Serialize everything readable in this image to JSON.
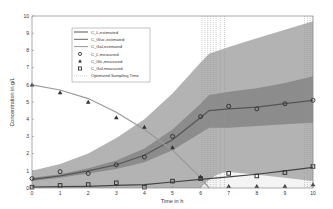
{
  "chart_data": {
    "type": "line",
    "title": "",
    "xlabel": "Time in h",
    "ylabel": "Concentration in g/L",
    "xlim": [
      0,
      10
    ],
    "ylim": [
      0,
      10
    ],
    "xticks": [
      "0",
      "1",
      "2",
      "3",
      "4",
      "5",
      "6",
      "7",
      "8",
      "9",
      "10"
    ],
    "yticks": [
      "0",
      "1",
      "2",
      "3",
      "4",
      "5",
      "6",
      "7",
      "8",
      "9",
      "10"
    ],
    "grid": false,
    "legend_position": "upper-left-inside",
    "legend": [
      {
        "label": "C_L,estimated",
        "style": "line",
        "color": "#555555"
      },
      {
        "label": "C_Gluc,estimated",
        "style": "line",
        "color": "#666666"
      },
      {
        "label": "C_Gal,estimated",
        "style": "line",
        "color": "#999999"
      },
      {
        "label": "C_L,measured",
        "style": "circle",
        "color": "#333333"
      },
      {
        "label": "C_Glc,measured",
        "style": "triangle",
        "color": "#333333"
      },
      {
        "label": "C_Gal,measured",
        "style": "square",
        "color": "#333333"
      },
      {
        "label": "Optimized Sampling Time",
        "style": "dotted",
        "color": "#aaaaaa"
      }
    ],
    "series": [
      {
        "name": "C_L,estimated",
        "kind": "line",
        "x": [
          0,
          1,
          2,
          3,
          4,
          5,
          6,
          6.3,
          7,
          8,
          9,
          10
        ],
        "y": [
          0.5,
          0.7,
          1.0,
          1.35,
          1.9,
          2.8,
          4.1,
          4.5,
          4.6,
          4.7,
          4.9,
          5.1
        ]
      },
      {
        "name": "C_Gluc,estimated",
        "kind": "line",
        "x": [
          0,
          1,
          2,
          3,
          4,
          5,
          6,
          6.3
        ],
        "y": [
          6.0,
          5.7,
          5.2,
          4.4,
          3.4,
          2.2,
          0.6,
          0.0
        ]
      },
      {
        "name": "C_Gal,estimated",
        "kind": "line",
        "x": [
          0,
          1,
          2,
          3,
          4,
          5,
          6,
          7,
          8,
          9,
          10
        ],
        "y": [
          0.05,
          0.08,
          0.1,
          0.15,
          0.2,
          0.35,
          0.5,
          0.65,
          0.8,
          1.0,
          1.2
        ]
      },
      {
        "name": "C_L,measured",
        "kind": "circle",
        "x": [
          0,
          1,
          2,
          3,
          4,
          5,
          6,
          7,
          8,
          9,
          10
        ],
        "y": [
          0.55,
          0.95,
          0.85,
          1.35,
          1.8,
          3.0,
          4.15,
          4.75,
          4.6,
          4.9,
          5.1
        ]
      },
      {
        "name": "C_Glc,measured",
        "kind": "triangle",
        "x": [
          0,
          1,
          2,
          3,
          4,
          5,
          6,
          7,
          8,
          9,
          10
        ],
        "y": [
          6.0,
          5.55,
          5.0,
          4.1,
          3.55,
          2.35,
          0.65,
          0.1,
          0.1,
          0.1,
          0.2
        ]
      },
      {
        "name": "C_Gal,measured",
        "kind": "square",
        "x": [
          0,
          1,
          2,
          3,
          4,
          5,
          6,
          7,
          8,
          9,
          10
        ],
        "y": [
          0.05,
          0.15,
          0.2,
          0.3,
          0.05,
          0.4,
          0.55,
          0.85,
          0.7,
          0.9,
          1.25
        ]
      }
    ],
    "bands": [
      {
        "name": "outer confidence band",
        "color": "#b3b3b3",
        "x": [
          0,
          1,
          2,
          3,
          4,
          5,
          6,
          6.3,
          7,
          8,
          9,
          10
        ],
        "upper": [
          1.0,
          1.4,
          2.0,
          2.9,
          4.0,
          5.5,
          7.3,
          7.8,
          8.2,
          8.7,
          9.2,
          9.7
        ],
        "lower": [
          0.0,
          0.0,
          0.0,
          0.0,
          0.0,
          0.0,
          0.0,
          0.0,
          0.0,
          0.0,
          0.0,
          0.0
        ]
      },
      {
        "name": "inner confidence band",
        "color": "#8c8c8c",
        "x": [
          0,
          1,
          2,
          3,
          4,
          5,
          6,
          6.3,
          7,
          8,
          9,
          10
        ],
        "upper": [
          0.6,
          0.8,
          1.15,
          1.6,
          2.3,
          3.4,
          4.9,
          5.4,
          5.6,
          5.8,
          6.1,
          6.5
        ],
        "lower": [
          0.4,
          0.6,
          0.85,
          1.1,
          1.5,
          2.2,
          3.2,
          3.5,
          3.5,
          3.6,
          3.7,
          3.8
        ]
      }
    ],
    "sampling_times": [
      6.05,
      6.15,
      6.25,
      6.35,
      6.45,
      6.55,
      6.7,
      6.85,
      9.7,
      9.8,
      9.9,
      10.0
    ]
  }
}
